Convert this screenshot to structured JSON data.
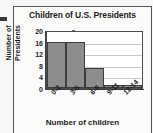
{
  "figure": {
    "background_color": "#f7f7f5",
    "border_color": "#555555"
  },
  "chart_data": {
    "type": "bar",
    "title": "Children of U.S. Presidents",
    "xlabel": "Number of children",
    "ylabel": "Number of Presidents",
    "ylabel_line1": "Number of",
    "ylabel_line2": "Presidents",
    "categories": [
      "0-2",
      "3-5",
      "6-8",
      "9-11",
      "12-14"
    ],
    "values": [
      16,
      16,
      7,
      1,
      1
    ],
    "yticks": [
      0,
      4,
      8,
      12,
      16,
      20
    ],
    "ylim": [
      0,
      20
    ],
    "grid": true,
    "legend": null,
    "bar_color": "#8d8d8d",
    "bar_edge_color": "#3c3c3c",
    "plot_background": "#ffffff",
    "gridline_color": "#c9c9c9"
  }
}
